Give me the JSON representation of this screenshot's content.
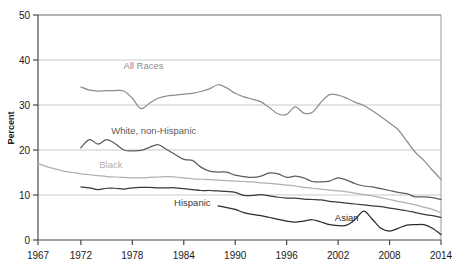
{
  "chart_data": {
    "type": "line",
    "title": "",
    "xlabel": "",
    "ylabel": "Percent",
    "xlim": [
      1967,
      2014
    ],
    "ylim": [
      0,
      50
    ],
    "ytick_labels": [
      "0",
      "10",
      "20",
      "30",
      "40",
      "50"
    ],
    "yticks": [
      0,
      10,
      20,
      30,
      40,
      50
    ],
    "xtick_labels": [
      "1967",
      "1972",
      "1978",
      "1984",
      "1990",
      "1996",
      "2002",
      "2008",
      "2014"
    ],
    "xticks": [
      1967,
      1972,
      1978,
      1984,
      1990,
      1996,
      2002,
      2008,
      2014
    ],
    "grid": "horizontal",
    "legend": "inline-annotations",
    "series": [
      {
        "name": "All Races",
        "color": "#8d8d8d",
        "label_x": 1979.3,
        "label_y": 38.0,
        "x": [
          1972,
          1973,
          1974,
          1975,
          1976,
          1977,
          1978,
          1979,
          1980,
          1981,
          1982,
          1983,
          1984,
          1985,
          1986,
          1987,
          1988,
          1989,
          1990,
          1991,
          1992,
          1993,
          1994,
          1995,
          1996,
          1997,
          1998,
          1999,
          2000,
          2001,
          2002,
          2003,
          2004,
          2005,
          2006,
          2007,
          2008,
          2009,
          2010,
          2011,
          2012,
          2013,
          2014
        ],
        "y": [
          34.0,
          33.3,
          33.1,
          33.2,
          33.2,
          33.1,
          31.5,
          29.2,
          30.4,
          31.5,
          32.0,
          32.2,
          32.4,
          32.6,
          33.0,
          33.6,
          34.5,
          33.8,
          32.6,
          31.8,
          31.3,
          30.7,
          29.4,
          28.0,
          27.9,
          29.6,
          28.2,
          28.4,
          30.6,
          32.3,
          32.2,
          31.5,
          30.6,
          29.9,
          28.7,
          27.4,
          26.0,
          24.5,
          22.0,
          19.5,
          17.7,
          15.5,
          13.5
        ],
        "note": "All Races line, falls from ~34% in 1972 to ~13% in 2014"
      },
      {
        "name": "White, non-Hispanic",
        "color": "#5c5c5c",
        "label_x": 1980.5,
        "label_y": 23.5,
        "x": [
          1972,
          1973,
          1974,
          1975,
          1976,
          1977,
          1978,
          1979,
          1980,
          1981,
          1982,
          1983,
          1984,
          1985,
          1986,
          1987,
          1988,
          1989,
          1990,
          1991,
          1992,
          1993,
          1994,
          1995,
          1996,
          1997,
          1998,
          1999,
          2000,
          2001,
          2002,
          2003,
          2004,
          2005,
          2006,
          2007,
          2008,
          2009,
          2010,
          2011,
          2012,
          2013,
          2014
        ],
        "y": [
          20.5,
          22.3,
          21.3,
          22.3,
          21.4,
          20.0,
          19.8,
          19.9,
          20.6,
          21.2,
          20.1,
          19.0,
          17.9,
          17.7,
          16.2,
          15.3,
          15.1,
          15.1,
          14.4,
          14.1,
          13.9,
          14.2,
          14.9,
          14.7,
          13.9,
          14.2,
          13.8,
          13.0,
          12.9,
          13.1,
          13.8,
          13.3,
          12.5,
          12.0,
          11.8,
          11.4,
          11.0,
          10.6,
          10.3,
          9.6,
          9.6,
          9.4,
          9.0
        ],
        "note": "White non-Hispanic series"
      },
      {
        "name": "Black",
        "color": "#b0b0b0",
        "label_x": 1975.5,
        "label_y": 16.0,
        "x": [
          1967,
          1968,
          1969,
          1970,
          1971,
          1972,
          1973,
          1974,
          1975,
          1976,
          1977,
          1978,
          1979,
          1980,
          1981,
          1982,
          1983,
          1984,
          1985,
          1986,
          1987,
          1988,
          1989,
          1990,
          1991,
          1992,
          1993,
          1994,
          1995,
          1996,
          1997,
          1998,
          1999,
          2000,
          2001,
          2002,
          2003,
          2004,
          2005,
          2006,
          2007,
          2008,
          2009,
          2010,
          2011,
          2012,
          2013,
          2014
        ],
        "y": [
          17.0,
          16.3,
          15.8,
          15.3,
          15.0,
          14.7,
          14.5,
          14.3,
          14.1,
          14.0,
          13.9,
          13.8,
          13.8,
          13.9,
          14.0,
          14.1,
          14.0,
          13.8,
          13.6,
          13.5,
          13.4,
          13.3,
          13.2,
          13.1,
          13.0,
          12.9,
          12.7,
          12.6,
          12.4,
          12.2,
          12.0,
          11.7,
          11.5,
          11.3,
          11.1,
          10.9,
          10.7,
          10.4,
          10.1,
          9.8,
          9.4,
          9.0,
          8.6,
          8.2,
          7.8,
          7.3,
          6.8,
          6.0
        ],
        "note": "Black series, gradual decline from 17% in 1967 to ~6% in 2014"
      },
      {
        "name": "Hispanic",
        "color": "#3a3a3a",
        "label_x": 1985.0,
        "label_y": 7.6,
        "x": [
          1972,
          1973,
          1974,
          1975,
          1976,
          1977,
          1978,
          1979,
          1980,
          1981,
          1982,
          1983,
          1984,
          1985,
          1986,
          1987,
          1988,
          1989,
          1990,
          1991,
          1992,
          1993,
          1994,
          1995,
          1996,
          1997,
          1998,
          1999,
          2000,
          2001,
          2002,
          2003,
          2004,
          2005,
          2006,
          2007,
          2008,
          2009,
          2010,
          2011,
          2012,
          2013,
          2014
        ],
        "y": [
          11.8,
          11.6,
          11.2,
          11.5,
          11.5,
          11.3,
          11.6,
          11.7,
          11.7,
          11.6,
          11.6,
          11.6,
          11.4,
          11.2,
          11.0,
          11.0,
          10.9,
          10.8,
          10.6,
          9.9,
          9.9,
          10.1,
          9.8,
          9.5,
          9.3,
          9.3,
          9.1,
          9.0,
          8.9,
          8.6,
          8.4,
          8.2,
          8.0,
          7.8,
          7.6,
          7.4,
          7.1,
          6.8,
          6.5,
          6.1,
          5.7,
          5.4,
          5.0
        ],
        "note": "Hispanic series"
      },
      {
        "name": "Asian",
        "color": "#2b2b2b",
        "label_x": 2003.0,
        "label_y": 4.3,
        "x": [
          1988,
          1989,
          1990,
          1991,
          1992,
          1993,
          1994,
          1995,
          1996,
          1997,
          1998,
          1999,
          2000,
          2001,
          2002,
          2003,
          2004,
          2005,
          2006,
          2007,
          2008,
          2009,
          2010,
          2011,
          2012,
          2013,
          2014
        ],
        "y": [
          7.6,
          7.2,
          6.8,
          6.1,
          5.7,
          5.4,
          5.0,
          4.6,
          4.2,
          4.0,
          4.2,
          4.5,
          4.0,
          3.4,
          3.2,
          3.3,
          4.6,
          6.4,
          4.6,
          2.6,
          2.0,
          2.6,
          3.3,
          3.4,
          3.4,
          2.6,
          1.2
        ],
        "note": "Asian series, lowest values, starts around 1988"
      }
    ]
  },
  "axes": {
    "y_axis_title": "Percent"
  }
}
